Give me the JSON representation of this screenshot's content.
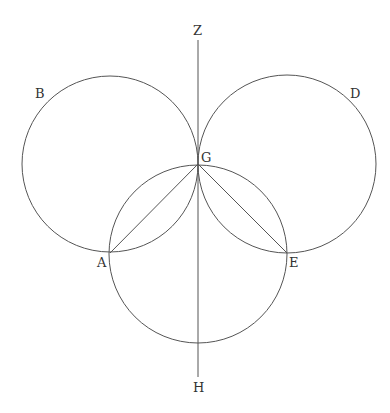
{
  "diagram": {
    "stroke_color": "#555555",
    "labels": {
      "Z": "Z",
      "B": "B",
      "D": "D",
      "G": "G",
      "A": "A",
      "E": "E",
      "H": "H"
    },
    "points": {
      "G": [
        198,
        164
      ],
      "A": [
        110,
        253
      ],
      "E": [
        287,
        253
      ],
      "Z_top": [
        198,
        40
      ],
      "H_bottom": [
        198,
        377
      ]
    },
    "circles": [
      {
        "name": "left-circle-B",
        "cx": 110,
        "cy": 164,
        "r": 88
      },
      {
        "name": "right-circle-D",
        "cx": 287,
        "cy": 164,
        "r": 89
      },
      {
        "name": "bottom-circle",
        "cx": 198,
        "cy": 254,
        "r": 89
      }
    ],
    "segments": [
      {
        "name": "line-ZH",
        "from": "Z_top",
        "to": "H_bottom"
      },
      {
        "name": "line-GA",
        "from": "G",
        "to": "A"
      },
      {
        "name": "line-GE",
        "from": "G",
        "to": "E"
      }
    ]
  }
}
